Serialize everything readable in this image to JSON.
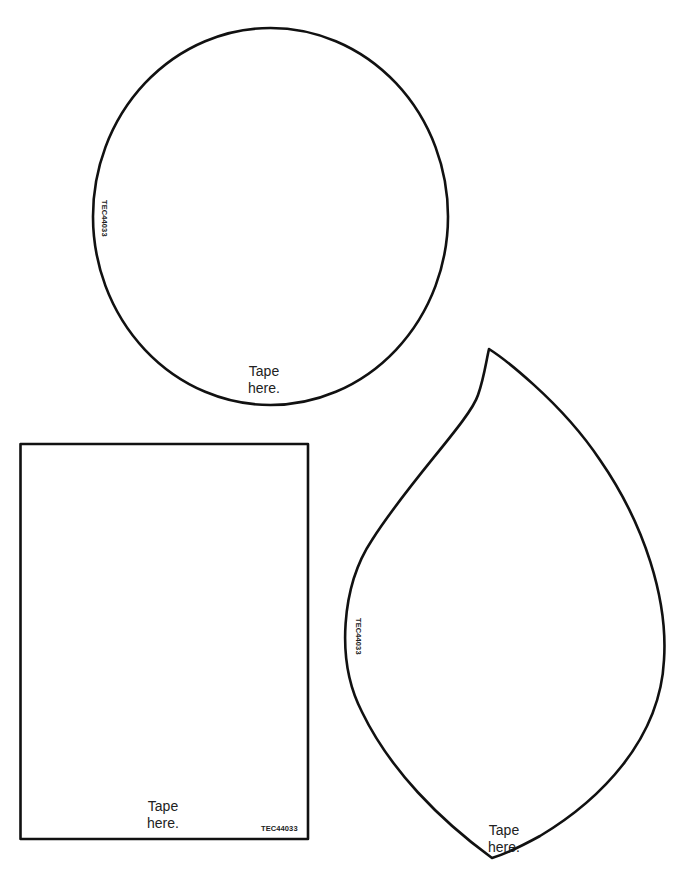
{
  "circle_shape": {
    "product_code": "TEC44033",
    "tape_label_line1": "Tape",
    "tape_label_line2": "here."
  },
  "rectangle_shape": {
    "product_code": "TEC44033",
    "tape_label_line1": "Tape",
    "tape_label_line2": "here."
  },
  "leaf_shape": {
    "product_code": "TEC44033",
    "tape_label_line1": "Tape",
    "tape_label_line2": "here."
  },
  "colors": {
    "outline": "#111111",
    "background": "#ffffff",
    "text": "#222222"
  }
}
